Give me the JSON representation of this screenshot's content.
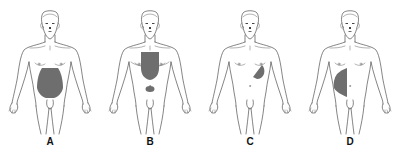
{
  "diagram": {
    "shade_color": "#6e6e6e",
    "outline_color": "#333333",
    "figures": [
      {
        "id": "A",
        "label": "A",
        "center_x": 50,
        "shaded_region": "lower-and-central-abdomen"
      },
      {
        "id": "B",
        "label": "B",
        "center_x": 150,
        "shaded_region": "retrosternal-epigastric-and-periumbilical"
      },
      {
        "id": "C",
        "label": "C",
        "center_x": 250,
        "shaded_region": "left-upper-quadrant"
      },
      {
        "id": "D",
        "label": "D",
        "center_x": 350,
        "shaded_region": "right-flank"
      }
    ]
  }
}
